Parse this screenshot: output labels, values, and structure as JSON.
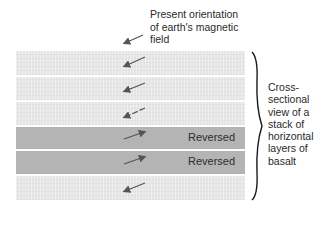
{
  "title_caption": {
    "line1": "Present orientation",
    "line2": "of earth's magnetic",
    "line3": "field"
  },
  "side_caption": {
    "lines": [
      "Cross-",
      "sectional",
      "view of a",
      "stack of",
      "horizontal",
      "layers of",
      "basalt"
    ]
  },
  "present_field_arrow": {
    "direction": "down-left"
  },
  "layers": [
    {
      "polarity": "normal",
      "arrow_direction": "down-left",
      "label": ""
    },
    {
      "polarity": "normal",
      "arrow_direction": "down-left",
      "label": ""
    },
    {
      "polarity": "normal",
      "arrow_direction": "down-left",
      "label": ""
    },
    {
      "polarity": "reversed",
      "arrow_direction": "up-right",
      "label": "Reversed"
    },
    {
      "polarity": "reversed",
      "arrow_direction": "up-right",
      "label": "Reversed"
    },
    {
      "polarity": "normal",
      "arrow_direction": "down-left",
      "label": ""
    }
  ],
  "colors": {
    "normal_layer": "#e6e6e6",
    "reversed_layer": "#b4b4b4",
    "arrow": "#555555",
    "text": "#2a2a2a"
  }
}
